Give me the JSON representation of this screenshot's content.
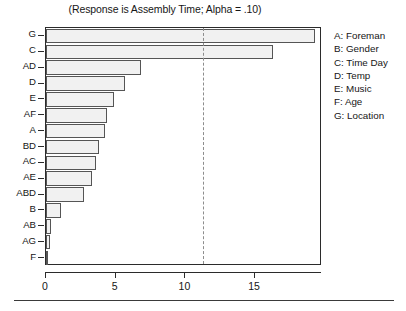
{
  "chart_data": {
    "type": "bar",
    "orientation": "horizontal",
    "title": "(Response is Assembly Time; Alpha = .10)",
    "xlabel": "",
    "ylabel": "",
    "categories": [
      "G",
      "C",
      "AD",
      "D",
      "E",
      "AF",
      "A",
      "BD",
      "AC",
      "AE",
      "ABD",
      "B",
      "AB",
      "AG",
      "F"
    ],
    "values": [
      19.3,
      16.3,
      6.8,
      5.7,
      4.9,
      4.4,
      4.2,
      3.8,
      3.6,
      3.3,
      2.7,
      1.1,
      0.35,
      0.3,
      0.1
    ],
    "xlim": [
      0,
      19.8
    ],
    "xticks": [
      0,
      5,
      10,
      15
    ],
    "xtick_labels": [
      "0",
      "5",
      "10",
      "15"
    ],
    "grid": false,
    "reference_line": {
      "value": 11.25,
      "style": "dashed",
      "color": "#8d8d8d"
    },
    "bar_fill_color": "#f1f1f1",
    "bar_border_color": "#555555",
    "frame_color": "#2b2b2b",
    "legend_position": "right",
    "legend": [
      "A: Foreman",
      "B: Gender",
      "C: Time Day",
      "D: Temp",
      "E: Music",
      "F: Age",
      "G: Location"
    ]
  },
  "caption": {
    "text": ""
  }
}
